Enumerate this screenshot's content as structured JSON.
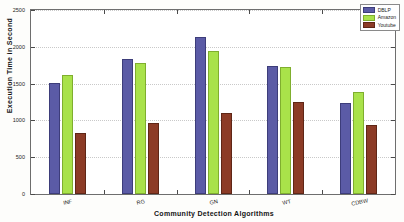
{
  "chart_data": {
    "type": "bar",
    "title": "",
    "xlabel": "Community Detection Algorithms",
    "ylabel": "Execution Time in Second",
    "categories": [
      "INF",
      "RG",
      "GN",
      "WT",
      "CDBW"
    ],
    "series": [
      {
        "name": "DBLP",
        "color": "#5b5ba6",
        "values": [
          1510,
          1830,
          2140,
          1740,
          1230
        ]
      },
      {
        "name": "Amazon",
        "color": "#a9e24a",
        "values": [
          1620,
          1780,
          1940,
          1730,
          1380
        ]
      },
      {
        "name": "Youtube",
        "color": "#8c3b26",
        "values": [
          830,
          970,
          1100,
          1250,
          940
        ]
      }
    ],
    "ylim": [
      0,
      2500
    ],
    "yticks": [
      0,
      500,
      1000,
      1500,
      2000,
      2500
    ],
    "ytick_labels": [
      "0",
      "500",
      "1000",
      "1500",
      "2000",
      "2500"
    ],
    "grid": true,
    "legend_position": "top-right"
  }
}
